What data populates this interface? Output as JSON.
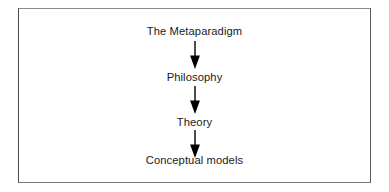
{
  "figure": {
    "type": "flowchart",
    "orientation": "vertical",
    "frame": {
      "border_color": "#6f6f6f",
      "background_color": "#ffffff"
    },
    "text_color": "#1a1a1a",
    "arrow_color": "#000000",
    "nodes": [
      {
        "id": "metaparadigm",
        "label": "The Metaparadigm"
      },
      {
        "id": "philosophy",
        "label": "Philosophy"
      },
      {
        "id": "theory",
        "label": "Theory"
      },
      {
        "id": "conceptual-models",
        "label": "Conceptual models"
      }
    ],
    "arrows": [
      {
        "id": "arrow-1",
        "from": "metaparadigm",
        "to": "philosophy",
        "direction": "down"
      },
      {
        "id": "arrow-2",
        "from": "philosophy",
        "to": "theory",
        "direction": "down"
      },
      {
        "id": "arrow-3",
        "from": "theory",
        "to": "conceptual-models",
        "direction": "down"
      }
    ]
  }
}
